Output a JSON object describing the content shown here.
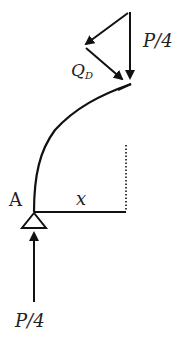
{
  "diagram": {
    "type": "structural-free-body-diagram",
    "colors": {
      "stroke": "#111111",
      "text": "#222222",
      "background": "#ffffff"
    },
    "labels": {
      "top_load": "P/4",
      "shear_main": "Q",
      "shear_sub": "D",
      "support": "A",
      "distance": "x",
      "reaction": "P/4"
    },
    "elements": [
      {
        "name": "curved-member",
        "from": "A",
        "to": "D"
      },
      {
        "name": "horizontal-reference",
        "from": "A",
        "length_label": "x"
      },
      {
        "name": "pin-support",
        "at": "A"
      },
      {
        "name": "reaction-force",
        "direction": "up",
        "label": "P/4"
      },
      {
        "name": "applied-load",
        "direction": "down",
        "label": "P/4"
      },
      {
        "name": "shear-force-components",
        "label": "Q_D"
      }
    ]
  }
}
